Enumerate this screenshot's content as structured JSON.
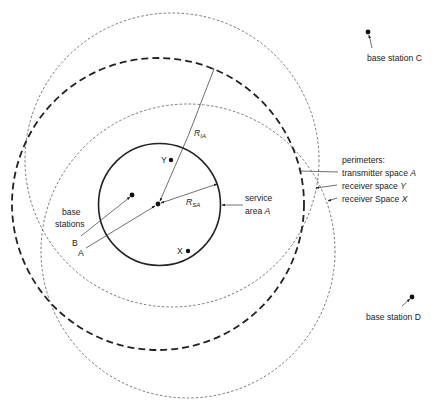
{
  "diagram": {
    "labels": {
      "base_station_c": "base station C",
      "base_station_d": "base station D",
      "perimeters_heading": "perimeters:",
      "perimeter_transmitter": "transmitter space ",
      "perimeter_transmitter_var": "A",
      "perimeter_receiver_y": "receiver space ",
      "perimeter_receiver_y_var": "Y",
      "perimeter_receiver_x": "receiver Space ",
      "perimeter_receiver_x_var": "X",
      "service_area_line1": "service",
      "service_area_line2": "area ",
      "service_area_var": "A",
      "base_stations_line1": "base",
      "base_stations_line2": "stations",
      "station_b": "B",
      "station_a": "A",
      "receiver_y": "Y",
      "receiver_x": "X",
      "radius_ia_main": "R",
      "radius_ia_sub": "IA",
      "radius_sa_main": "R",
      "radius_sa_sub": "SA"
    },
    "circles": {
      "service_area_a": {
        "cx": 159.5,
        "cy": 204.5,
        "r": 61,
        "style": "solid"
      },
      "transmitter_space_a": {
        "cx": 158,
        "cy": 204,
        "r": 146,
        "style": "thick-dashed"
      },
      "receiver_space_y": {
        "cx": 172,
        "cy": 160,
        "r": 147,
        "style": "thin-dashed"
      },
      "receiver_space_x": {
        "cx": 188,
        "cy": 251,
        "r": 147,
        "style": "thin-dashed"
      }
    },
    "points": {
      "base_station_a": [
        158,
        204
      ],
      "base_station_b": [
        132,
        195
      ],
      "base_station_c": [
        368,
        32
      ],
      "base_station_d": [
        412,
        297
      ],
      "receiver_y": [
        171,
        160
      ],
      "receiver_x": [
        188,
        251
      ]
    },
    "colors": {
      "ink": "#222222",
      "thin": "#555555"
    }
  }
}
